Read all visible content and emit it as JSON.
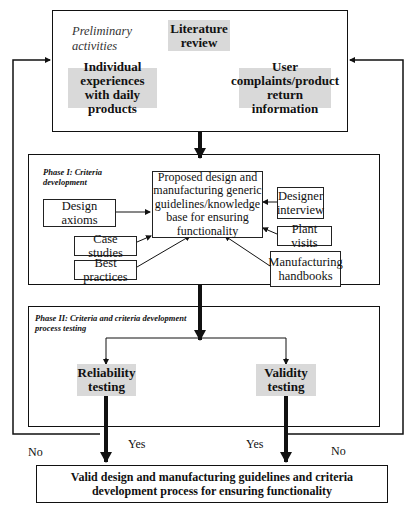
{
  "preliminary": {
    "label": "Preliminary activities",
    "label_line1": "Preliminary",
    "label_line2": "activities",
    "items": [
      {
        "line1": "Literature",
        "line2": "review"
      },
      {
        "line1": "Individual",
        "line2": "experiences",
        "line3": "with daily products"
      },
      {
        "line1": "User",
        "line2": "complaints/product",
        "line3": "return information"
      }
    ]
  },
  "phase1": {
    "label_line1": "Phase I: Criteria",
    "label_line2": "development",
    "central": {
      "line1": "Proposed design and",
      "line2": "manufacturing generic",
      "line3": "guidelines/knowledge",
      "line4": "base for ensuring",
      "line5": "functionality"
    },
    "sources": {
      "design_axioms": "Design axioms",
      "case_studies": "Case studies",
      "best_practices": "Best practices",
      "designer_interview_1": "Designer",
      "designer_interview_2": "interview",
      "plant_visits": "Plant visits",
      "handbooks_1": "Manufacturing",
      "handbooks_2": "handbooks"
    }
  },
  "phase2": {
    "label_line1": "Phase II: Criteria and criteria development",
    "label_line2": "process testing",
    "reliability": {
      "line1": "Reliability",
      "line2": "testing"
    },
    "validity": {
      "line1": "Validity",
      "line2": "testing"
    }
  },
  "edges": {
    "yes_left": "Yes",
    "yes_right": "Yes",
    "no_left": "No",
    "no_right": "No"
  },
  "final": {
    "line1": "Valid design and manufacturing guidelines and criteria",
    "line2": "development process for ensuring functionality"
  }
}
